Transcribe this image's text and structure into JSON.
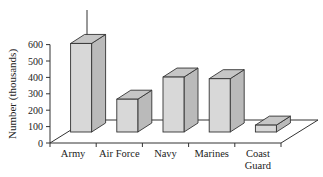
{
  "chart_data": {
    "type": "bar",
    "title": "",
    "xlabel": "",
    "ylabel": "Number (thousands)",
    "categories": [
      "Army",
      "Air Force",
      "Navy",
      "Marines",
      "Coast Guard"
    ],
    "category_lines": [
      [
        "Army"
      ],
      [
        "Air Force"
      ],
      [
        "Navy"
      ],
      [
        "Marines"
      ],
      [
        "Coast",
        "Guard"
      ]
    ],
    "values": [
      540,
      200,
      335,
      325,
      42
    ],
    "ylim": [
      0,
      600
    ],
    "yticks": [
      0,
      100,
      200,
      300,
      400,
      500,
      600
    ],
    "grid": false,
    "legend": null,
    "style": "3d-bar",
    "colors": {
      "front": "#d8d8d8",
      "top": "#c6c6c6",
      "side": "#bababa",
      "stroke": "#333333"
    }
  }
}
